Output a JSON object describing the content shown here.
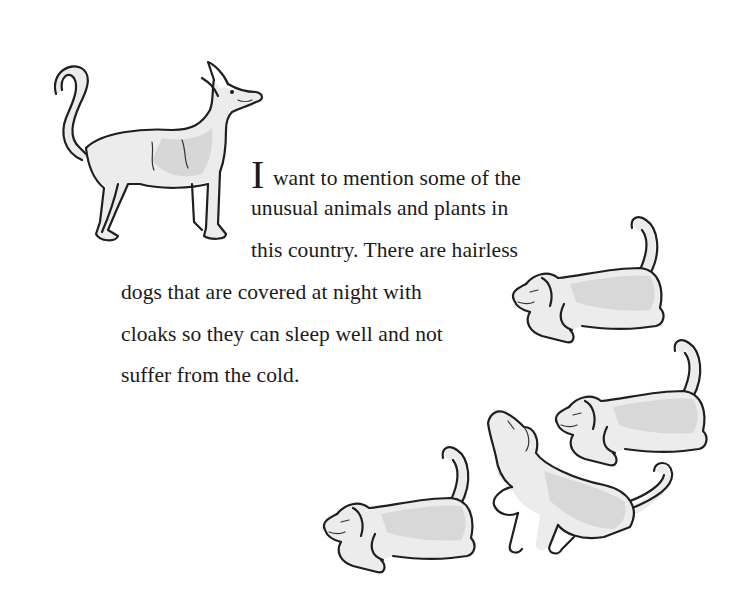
{
  "passage": {
    "drop_cap": "I",
    "lines": [
      " want to mention some of the",
      "unusual animals and plants in",
      "this country. There are hairless",
      "dogs that are covered at night with",
      "cloaks so they can sleep well and not",
      "suffer from the cold."
    ]
  },
  "illustrations": {
    "standing_dog": "standing hairless dog with curled tail, looking up-right",
    "crouching_dogs": [
      "crouching dog facing left (upper right)",
      "crouching dog facing left (middle right)",
      "dog rearing up, looking upward (center)",
      "crouching dog facing left (lower left)"
    ]
  },
  "colors": {
    "background": "#ffffff",
    "text": "#1a1a1a",
    "ink": "#1f1f1f",
    "dog_fill": "#ececec"
  }
}
